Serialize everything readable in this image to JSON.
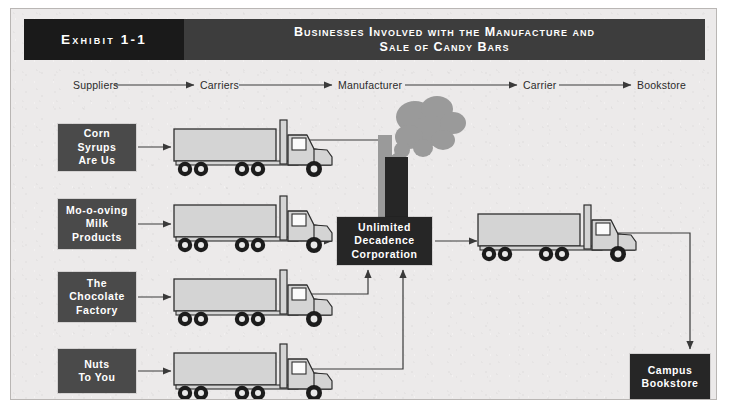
{
  "exhibit": {
    "label": "Exhibit 1-1",
    "title_line1": "Businesses Involved with the Manufacture and",
    "title_line2": "Sale of Candy Bars",
    "header_left_color": "#1a1a1a",
    "header_right_color": "#3d3d3d",
    "background_color": "#eceaea",
    "box_color": "#4a4a4a",
    "dark_box_color": "#262626",
    "text_color": "#ffffff",
    "line_color": "#3a3a3a"
  },
  "flow_labels": [
    {
      "text": "Suppliers",
      "x": 63,
      "y": 79
    },
    {
      "text": "Carriers",
      "x": 190,
      "y": 79
    },
    {
      "text": "Manufacturer",
      "x": 328,
      "y": 79
    },
    {
      "text": "Carrier",
      "x": 513,
      "y": 79
    },
    {
      "text": "Bookstore",
      "x": 627,
      "y": 79
    }
  ],
  "suppliers": [
    {
      "name": "supplier-corn-syrups",
      "lines": [
        "Corn",
        "Syrups",
        "Are Us"
      ],
      "x": 47,
      "y": 115,
      "w": 78,
      "h": 47
    },
    {
      "name": "supplier-milk-products",
      "lines": [
        "Mo-o-oving",
        "Milk",
        "Products"
      ],
      "x": 47,
      "y": 190,
      "w": 78,
      "h": 50
    },
    {
      "name": "supplier-chocolate-factory",
      "lines": [
        "The",
        "Chocolate",
        "Factory"
      ],
      "x": 47,
      "y": 263,
      "w": 78,
      "h": 50
    },
    {
      "name": "supplier-nuts-to-you",
      "lines": [
        "Nuts",
        "To You"
      ],
      "x": 47,
      "y": 340,
      "w": 78,
      "h": 44
    }
  ],
  "manufacturer": {
    "name": "manufacturer-box",
    "lines": [
      "Unlimited",
      "Decadence",
      "Corporation"
    ],
    "x": 326,
    "y": 208,
    "w": 95,
    "h": 48
  },
  "bookstore": {
    "name": "bookstore-box",
    "lines": [
      "Campus",
      "Bookstore"
    ],
    "x": 619,
    "y": 345,
    "w": 80,
    "h": 46
  },
  "trucks": [
    {
      "name": "truck-supplier-1",
      "x": 163,
      "y": 120
    },
    {
      "name": "truck-supplier-2",
      "x": 163,
      "y": 196
    },
    {
      "name": "truck-supplier-3",
      "x": 163,
      "y": 270
    },
    {
      "name": "truck-supplier-4",
      "x": 163,
      "y": 344
    },
    {
      "name": "truck-delivery",
      "x": 470,
      "y": 212
    }
  ],
  "smokestack": {
    "name": "smokestack",
    "dark_x": 374,
    "dark_y": 140,
    "dark_w": 23,
    "dark_h": 70,
    "gray_x": 367,
    "gray_y": 118,
    "gray_w": 14,
    "gray_h": 92
  },
  "icons": {
    "truck": "truck-icon",
    "smoke": "smoke-icon",
    "arrow": "arrow-icon"
  }
}
